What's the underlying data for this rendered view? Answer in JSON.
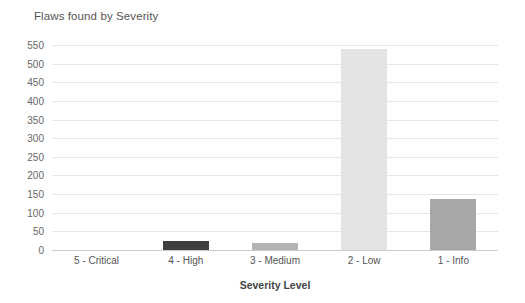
{
  "chart_data": {
    "type": "bar",
    "title": "Flaws found by Severity",
    "xlabel": "Severity Level",
    "ylabel": "",
    "categories": [
      "5 - Critical",
      "4 - High",
      "3 - Medium",
      "2 - Low",
      "1 - Info"
    ],
    "values": [
      0,
      25,
      18,
      540,
      138
    ],
    "ylim": [
      0,
      550
    ],
    "ytick_step": 50,
    "yticks": [
      0,
      50,
      100,
      150,
      200,
      250,
      300,
      350,
      400,
      450,
      500,
      550
    ],
    "ytick_labels": [
      "0",
      "50",
      "100",
      "150",
      "200",
      "250",
      "300",
      "350",
      "400",
      "450",
      "500",
      "550"
    ],
    "grid": true,
    "legend": false,
    "legend_position": "none",
    "bar_colors": [
      "#ffffff",
      "#3f3f3f",
      "#b3b3b3",
      "#e4e4e4",
      "#a8a8a8"
    ],
    "series": [
      {
        "name": "Flaws found",
        "points": [
          {
            "category": "5 - Critical",
            "value": 0,
            "color": "#ffffff"
          },
          {
            "category": "4 - High",
            "value": 25,
            "color": "#3f3f3f"
          },
          {
            "category": "3 - Medium",
            "value": 18,
            "color": "#b3b3b3"
          },
          {
            "category": "2 - Low",
            "value": 540,
            "color": "#e4e4e4"
          },
          {
            "category": "1 - Info",
            "value": 138,
            "color": "#a8a8a8"
          }
        ]
      }
    ],
    "colors": {
      "background": "#ffffff",
      "gridline": "#e6e6e6",
      "baseline": "#cccccc",
      "title_text": "#555555",
      "tick_text": "#666666",
      "axis_title_text": "#444444"
    }
  }
}
